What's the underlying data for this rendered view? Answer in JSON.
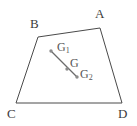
{
  "figure": {
    "kind": "geometry-diagram",
    "canvas": {
      "width": 137,
      "height": 126,
      "background": "#ffffff"
    },
    "colors": {
      "outline": "#4a4a4a",
      "segment": "#6b6b6b",
      "point_fill": "#8c8c8c",
      "vertex_label": "#3c3c3c",
      "point_label": "#565656"
    },
    "quadrilateral": {
      "name": "ABCD",
      "stroke": "#4a4a4a",
      "stroke_width": 1,
      "fill": "none",
      "vertices": [
        {
          "label": "A",
          "x": 100,
          "y": 28
        },
        {
          "label": "B",
          "x": 38,
          "y": 37
        },
        {
          "label": "C",
          "x": 16,
          "y": 103
        },
        {
          "label": "D",
          "x": 122,
          "y": 103
        }
      ],
      "path": "M 100 28 L 38 37 L 16 103 L 122 103 Z"
    },
    "segment": {
      "label": "G1G2",
      "stroke": "#6b6b6b",
      "stroke_width": 1.2,
      "x1": 51,
      "y1": 51,
      "x2": 77,
      "y2": 77
    },
    "points": [
      {
        "label": "G₁",
        "plain": "G1",
        "x": 51,
        "y": 51,
        "r": 1.7
      },
      {
        "label": "G",
        "plain": "G",
        "x": 67,
        "y": 69,
        "r": 1.7
      },
      {
        "label": "G₂",
        "plain": "G2",
        "x": 77,
        "y": 77,
        "r": 1.7
      }
    ],
    "labels": {
      "A": "A",
      "B": "B",
      "C": "C",
      "D": "D",
      "G1_main": "G",
      "G1_sub": "1",
      "G_main": "G",
      "G2_main": "G",
      "G2_sub": "2"
    }
  }
}
